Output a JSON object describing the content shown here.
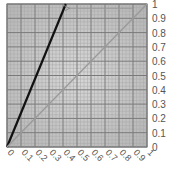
{
  "chart_data": {
    "type": "line",
    "title": "",
    "xlabel": "",
    "ylabel": "",
    "xlim": [
      0,
      1
    ],
    "ylim": [
      0,
      1
    ],
    "grid": true,
    "x_ticks": [
      "0",
      "0.1",
      "0.2",
      "0.3",
      "0.4",
      "0.5",
      "0.6",
      "0.7",
      "0.8",
      "0.9",
      "1"
    ],
    "y_ticks": [
      "0",
      "0.1",
      "0.2",
      "0.3",
      "0.4",
      "0.5",
      "0.6",
      "0.7",
      "0.8",
      "0.9",
      "1"
    ],
    "y_axis_position": "right",
    "series": [
      {
        "name": "steep line",
        "color": "#111111",
        "x": [
          0,
          0.42
        ],
        "y": [
          0,
          1
        ]
      },
      {
        "name": "diagonal",
        "color": "#9a9a9a",
        "x": [
          0,
          1
        ],
        "y": [
          0,
          1
        ]
      }
    ],
    "annotations": [
      {
        "type": "arrow",
        "from": [
          0.9,
          0.97
        ],
        "to": [
          0.44,
          0.97
        ],
        "color": "#999999"
      }
    ]
  },
  "colors": {
    "plot_background": "#c8c8c8",
    "major_grid": "#7a7a7a",
    "minor_grid": "#a8a8a8",
    "tick_text": "#555555"
  }
}
